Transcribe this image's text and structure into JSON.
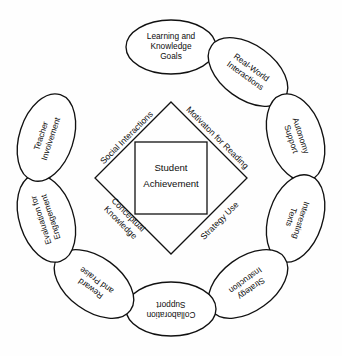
{
  "diagram": {
    "center": {
      "square_label_line1": "Student",
      "square_label_line2": "Achievement"
    },
    "diamond_edges": [
      {
        "id": "social-interactions",
        "label": "Social Interactions",
        "position": "upper-left",
        "rotation": -45
      },
      {
        "id": "motivaton-for-reading",
        "label": "Motivaton for Reading",
        "position": "upper-right",
        "rotation": 45
      },
      {
        "id": "conceptual-knowledge",
        "label_line1": "Conceptual",
        "label_line2": "Knowledge",
        "position": "lower-left",
        "rotation": 45
      },
      {
        "id": "strategy-use",
        "label": "Strategy Use",
        "position": "lower-right",
        "rotation": -45
      }
    ],
    "ring_nodes": [
      {
        "id": "learning-and-knowledge-goals",
        "lines": [
          "Learning and",
          "Knowledge",
          "Goals"
        ],
        "angle_deg": 0,
        "text_rotation": 0
      },
      {
        "id": "real-world-interactions",
        "lines": [
          "Real-World",
          "Interactions"
        ],
        "angle_deg": 36,
        "text_rotation": 36
      },
      {
        "id": "autonomy-support",
        "lines": [
          "Autonomy",
          "Support"
        ],
        "angle_deg": 72,
        "text_rotation": 72
      },
      {
        "id": "interesting-texts",
        "lines": [
          "Interesting",
          "Texts"
        ],
        "angle_deg": 108,
        "text_rotation": 108
      },
      {
        "id": "strategy-instruction",
        "lines": [
          "Strategy",
          "Instruction"
        ],
        "angle_deg": 144,
        "text_rotation": 144
      },
      {
        "id": "collaboration-support",
        "lines": [
          "Collaboration",
          "Support"
        ],
        "angle_deg": 180,
        "text_rotation": 180
      },
      {
        "id": "reward-and-praise",
        "lines": [
          "Reward",
          "and Praise"
        ],
        "angle_deg": 216,
        "text_rotation": 216
      },
      {
        "id": "evaluation-for-engagement",
        "lines": [
          "Evaluation for",
          "Engagement"
        ],
        "angle_deg": 252,
        "text_rotation": 252
      },
      {
        "id": "teacher-involvement",
        "lines": [
          "Teacher",
          "Involvement"
        ],
        "angle_deg": 288,
        "text_rotation": 288
      },
      {
        "id": "learning-goals-placeholder",
        "lines": [
          "Teacher",
          "Involvement"
        ],
        "angle_deg": 324,
        "text_rotation": 324,
        "hidden": true
      }
    ],
    "colors": {
      "stroke": "#111111",
      "fill": "#ffffff",
      "text": "#0d0d0d",
      "background": "#fefefe"
    },
    "geometry": {
      "canvas_width": 342,
      "canvas_height": 356,
      "center_x": 171,
      "center_y": 178,
      "ring_radius": 131,
      "ellipse_rx": 45,
      "ellipse_ry": 27,
      "diamond_radius": 76,
      "square_half": 36
    }
  }
}
